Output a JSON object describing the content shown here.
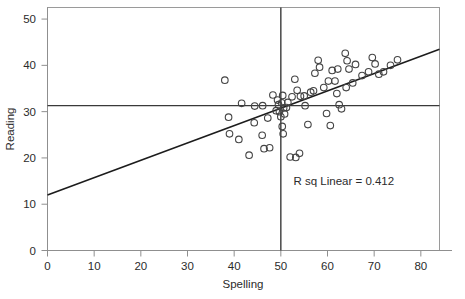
{
  "chart_data": {
    "type": "scatter",
    "title": "",
    "xlabel": "Spelling",
    "ylabel": "Reading",
    "xlim": [
      0,
      84
    ],
    "ylim": [
      0,
      52.5
    ],
    "xticks": [
      0,
      10,
      20,
      30,
      40,
      50,
      60,
      70,
      80
    ],
    "xtick_labels": [
      "0",
      "10",
      "20",
      "30",
      "40",
      "50",
      "60",
      "70",
      "80"
    ],
    "yticks": [
      0,
      10,
      20,
      30,
      40,
      50
    ],
    "ytick_labels": [
      "0",
      "10",
      "20",
      "30",
      "40",
      "50"
    ],
    "grid": false,
    "legend": null,
    "annotations": [
      {
        "name": "r-squared-annotation",
        "text": "R sq Linear = 0.412",
        "x": 63.5,
        "y": 14.2
      }
    ],
    "reference_lines": [
      {
        "name": "vertical-reference-line",
        "orientation": "vertical",
        "value": 50
      },
      {
        "name": "horizontal-reference-line",
        "orientation": "horizontal",
        "value": 31.3
      }
    ],
    "fit_line": {
      "name": "linear-regression-line",
      "type": "linear",
      "intercept": 12.0,
      "slope": 0.375,
      "x_start": 0,
      "x_end": 84,
      "y_start": 12.0,
      "y_end": 43.5,
      "r_squared": 0.412
    },
    "marker": "open-circle",
    "points": [
      {
        "x": 38.0,
        "y": 36.8
      },
      {
        "x": 38.8,
        "y": 28.8
      },
      {
        "x": 41.6,
        "y": 31.8
      },
      {
        "x": 39.0,
        "y": 25.2
      },
      {
        "x": 41.0,
        "y": 24.0
      },
      {
        "x": 43.2,
        "y": 20.6
      },
      {
        "x": 44.4,
        "y": 31.2
      },
      {
        "x": 46.1,
        "y": 31.3
      },
      {
        "x": 46.0,
        "y": 24.9
      },
      {
        "x": 44.3,
        "y": 27.6
      },
      {
        "x": 47.2,
        "y": 28.6
      },
      {
        "x": 46.4,
        "y": 22.0
      },
      {
        "x": 47.6,
        "y": 22.2
      },
      {
        "x": 48.3,
        "y": 33.6
      },
      {
        "x": 49.0,
        "y": 30.2
      },
      {
        "x": 49.3,
        "y": 32.5
      },
      {
        "x": 49.5,
        "y": 31.5
      },
      {
        "x": 49.7,
        "y": 30.0
      },
      {
        "x": 50.2,
        "y": 31.9
      },
      {
        "x": 50.4,
        "y": 33.5
      },
      {
        "x": 50.6,
        "y": 30.8
      },
      {
        "x": 50.0,
        "y": 28.9
      },
      {
        "x": 50.3,
        "y": 26.8
      },
      {
        "x": 50.5,
        "y": 25.2
      },
      {
        "x": 50.8,
        "y": 29.5
      },
      {
        "x": 51.2,
        "y": 30.9
      },
      {
        "x": 51.5,
        "y": 32.0
      },
      {
        "x": 52.0,
        "y": 20.2
      },
      {
        "x": 53.2,
        "y": 20.1
      },
      {
        "x": 54.0,
        "y": 21.0
      },
      {
        "x": 52.4,
        "y": 33.2
      },
      {
        "x": 53.0,
        "y": 37.0
      },
      {
        "x": 53.5,
        "y": 34.6
      },
      {
        "x": 54.2,
        "y": 33.3
      },
      {
        "x": 55.0,
        "y": 33.4
      },
      {
        "x": 55.8,
        "y": 27.2
      },
      {
        "x": 55.2,
        "y": 31.3
      },
      {
        "x": 56.4,
        "y": 34.2
      },
      {
        "x": 57.3,
        "y": 38.3
      },
      {
        "x": 57.0,
        "y": 34.5
      },
      {
        "x": 58.0,
        "y": 41.1
      },
      {
        "x": 58.3,
        "y": 39.6
      },
      {
        "x": 59.2,
        "y": 35.2
      },
      {
        "x": 59.8,
        "y": 29.6
      },
      {
        "x": 60.2,
        "y": 36.6
      },
      {
        "x": 60.6,
        "y": 27.0
      },
      {
        "x": 61.0,
        "y": 38.9
      },
      {
        "x": 61.6,
        "y": 36.6
      },
      {
        "x": 62.2,
        "y": 39.2
      },
      {
        "x": 62.0,
        "y": 33.9
      },
      {
        "x": 62.5,
        "y": 31.5
      },
      {
        "x": 63.0,
        "y": 30.6
      },
      {
        "x": 63.8,
        "y": 42.6
      },
      {
        "x": 64.2,
        "y": 41.0
      },
      {
        "x": 64.6,
        "y": 39.2
      },
      {
        "x": 64.0,
        "y": 35.2
      },
      {
        "x": 65.4,
        "y": 36.2
      },
      {
        "x": 66.0,
        "y": 40.2
      },
      {
        "x": 67.4,
        "y": 37.8
      },
      {
        "x": 68.8,
        "y": 38.6
      },
      {
        "x": 69.6,
        "y": 41.7
      },
      {
        "x": 70.2,
        "y": 40.3
      },
      {
        "x": 71.0,
        "y": 38.1
      },
      {
        "x": 72.0,
        "y": 38.6
      },
      {
        "x": 73.5,
        "y": 40.0
      },
      {
        "x": 75.0,
        "y": 41.2
      }
    ]
  },
  "axes": {
    "x_axis_name": "Spelling",
    "y_axis_name": "Reading"
  }
}
